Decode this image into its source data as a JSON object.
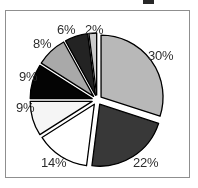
{
  "figure": {
    "background_color": "#ffffff",
    "frame_color": "#8f8f8f",
    "label_color": "#2e2e2e"
  },
  "chart_data": {
    "type": "pie",
    "title": "",
    "subtitle": "",
    "xlabel": "",
    "ylabel": "",
    "exploded": true,
    "legend_position": "none",
    "grid": false,
    "start_angle_deg": 0,
    "direction": "clockwise",
    "center": {
      "x": 97,
      "y": 100
    },
    "radius": 62,
    "explode_offset": 5,
    "categories": [
      "Slice 1",
      "Slice 2",
      "Slice 3",
      "Slice 4",
      "Slice 5",
      "Slice 6",
      "Slice 7",
      "Slice 8"
    ],
    "values": [
      30,
      22,
      14,
      9,
      9,
      8,
      6,
      2
    ],
    "labels": [
      "30%",
      "22%",
      "14%",
      "9%",
      "9%",
      "8%",
      "6%",
      "2%"
    ],
    "colors": [
      "#b6b6b6",
      "#3a3a3a",
      "#ffffff",
      "#f2f2f2",
      "#080808",
      "#a8a8a8",
      "#262626",
      "#c9c9c9"
    ],
    "edge_color": "#000000",
    "total": 100,
    "units": "percent",
    "slices": [
      {
        "label": "30%",
        "value": 30,
        "color": "#b6b6b6",
        "start_deg": 0,
        "end_deg": 108
      },
      {
        "label": "22%",
        "value": 22,
        "color": "#3a3a3a",
        "start_deg": 108,
        "end_deg": 187.2
      },
      {
        "label": "14%",
        "value": 14,
        "color": "#ffffff",
        "start_deg": 187.2,
        "end_deg": 237.6
      },
      {
        "label": "9%",
        "value": 9,
        "color": "#f2f2f2",
        "start_deg": 237.6,
        "end_deg": 270
      },
      {
        "label": "9%",
        "value": 9,
        "color": "#080808",
        "start_deg": 270,
        "end_deg": 302.4
      },
      {
        "label": "8%",
        "value": 8,
        "color": "#a8a8a8",
        "start_deg": 302.4,
        "end_deg": 331.2
      },
      {
        "label": "6%",
        "value": 6,
        "color": "#262626",
        "start_deg": 331.2,
        "end_deg": 352.8
      },
      {
        "label": "2%",
        "value": 2,
        "color": "#c9c9c9",
        "start_deg": 352.8,
        "end_deg": 360
      }
    ],
    "label_positions": [
      {
        "label": "30%",
        "x": 148,
        "y": 48
      },
      {
        "label": "22%",
        "x": 133,
        "y": 155
      },
      {
        "label": "14%",
        "x": 41,
        "y": 155
      },
      {
        "label": "9%",
        "x": 16,
        "y": 100
      },
      {
        "label": "9%",
        "x": 19,
        "y": 69
      },
      {
        "label": "8%",
        "x": 33,
        "y": 36
      },
      {
        "label": "6%",
        "x": 57,
        "y": 22
      },
      {
        "label": "2%",
        "x": 85,
        "y": 22
      }
    ]
  }
}
